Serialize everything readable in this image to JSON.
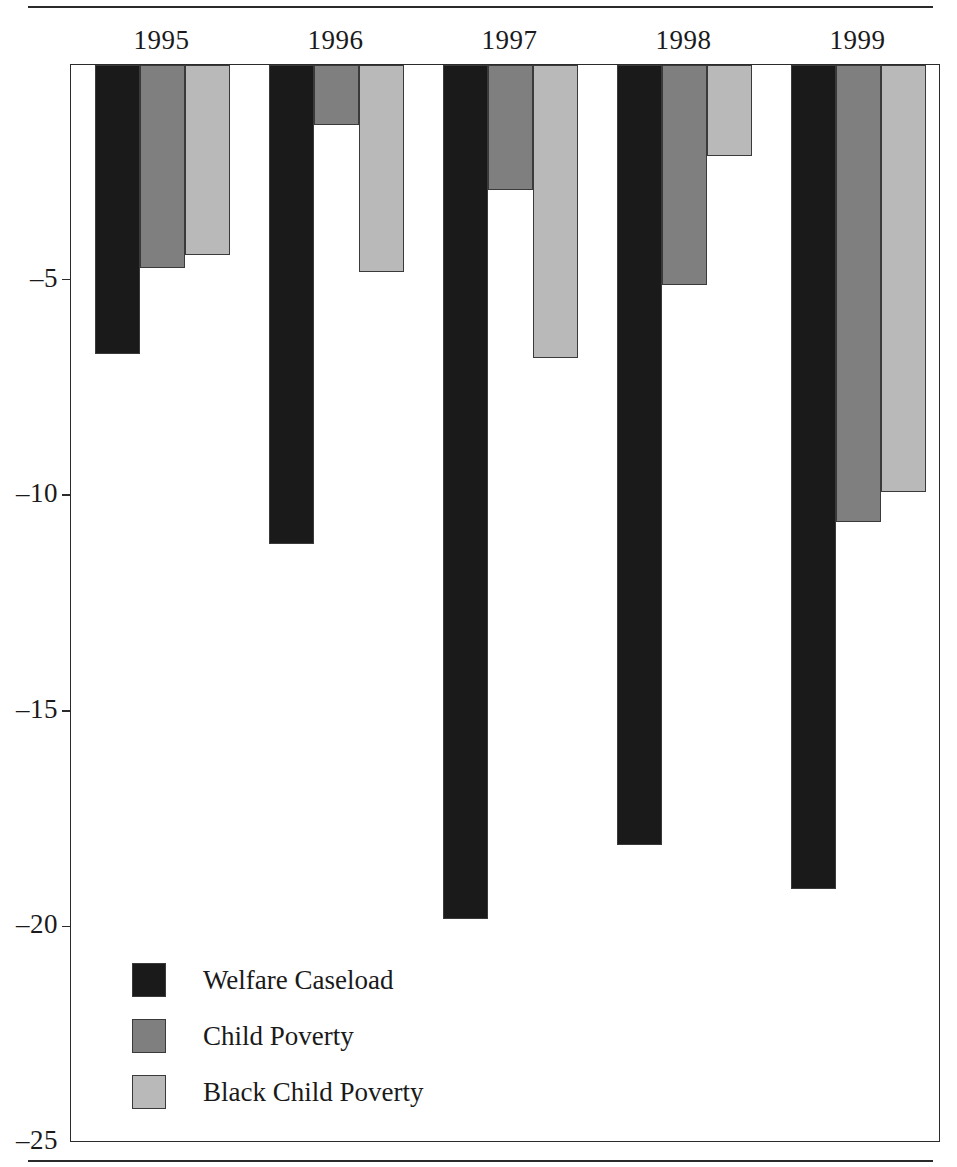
{
  "chart_data": {
    "type": "bar",
    "title": "",
    "subtitle": "",
    "xlabel": "",
    "ylabel": "",
    "categories": [
      "1995",
      "1996",
      "1997",
      "1998",
      "1999"
    ],
    "series": [
      {
        "name": "Welfare Caseload",
        "color": "#1a1a1a",
        "values": [
          -6.7,
          -11.1,
          -19.8,
          -18.1,
          -19.1
        ]
      },
      {
        "name": "Child Poverty",
        "color": "#7f7f7f",
        "values": [
          -4.7,
          -1.4,
          -2.9,
          -5.1,
          -10.6
        ]
      },
      {
        "name": "Black Child Poverty",
        "color": "#b9b9b9",
        "values": [
          -4.4,
          -4.8,
          -6.8,
          -2.1,
          -9.9
        ]
      }
    ],
    "ylim": [
      -25,
      0
    ],
    "y_ticks": [
      -5,
      -10,
      -15,
      -20,
      -25
    ],
    "y_tick_labels": [
      "–5",
      "–10",
      "–15",
      "–20",
      "–25"
    ],
    "grid": false,
    "legend_position": "inside-bottom-left",
    "orientation": "vertical",
    "bar_direction": "downward-from-zero"
  },
  "axis": {
    "y_labels": [
      "–5",
      "–10",
      "–15",
      "–20",
      "–25"
    ],
    "x_labels": [
      "1995",
      "1996",
      "1997",
      "1998",
      "1999"
    ]
  },
  "legend": {
    "items": [
      {
        "label": "Welfare Caseload",
        "swatch": "#1a1a1a"
      },
      {
        "label": "Child Poverty",
        "swatch": "#7f7f7f"
      },
      {
        "label": "Black Child Poverty",
        "swatch": "#b9b9b9"
      }
    ]
  },
  "colors": {
    "welfare_caseload": "#1a1a1a",
    "child_poverty": "#7f7f7f",
    "black_child_poverty": "#b9b9b9",
    "ink": "#2b2b2b",
    "background": "#ffffff"
  }
}
